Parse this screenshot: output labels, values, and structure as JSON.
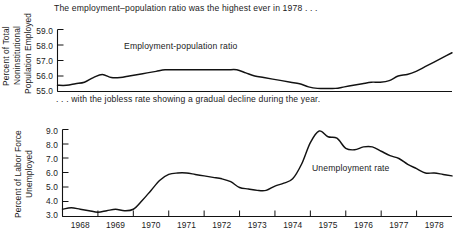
{
  "figure": {
    "caption_top": "The employment–population ratio was the highest ever in 1978 . . .",
    "caption_middle": ". . . with the jobless rate showing a gradual decline during the year.",
    "line_color": "#121212",
    "background": "#ffffff"
  },
  "chart_data": [
    {
      "type": "line",
      "title": "The employment–population ratio was the highest ever in 1978 . . .",
      "series_label": "Employment-population ratio",
      "xlabel": "",
      "ylabel": "Percent of Total Noninstitutional Population Employed",
      "ylabel_lines": [
        "Percent of Total",
        "Noninstitutional",
        "Population Employed"
      ],
      "ytick_labels": [
        "59.0",
        "58.0",
        "57.0",
        "56.0",
        "55.0"
      ],
      "ylim": [
        55.0,
        59.0
      ],
      "xlim": [
        1968.0,
        1979.0
      ],
      "grid": false,
      "legend": "inline-annotation",
      "x": [
        1968.0,
        1968.25,
        1968.5,
        1968.75,
        1969.0,
        1969.25,
        1969.5,
        1969.75,
        1970.0,
        1970.25,
        1970.5,
        1970.75,
        1971.0,
        1971.25,
        1971.5,
        1971.75,
        1972.0,
        1972.25,
        1972.5,
        1972.75,
        1973.0,
        1973.25,
        1973.5,
        1973.75,
        1974.0,
        1974.25,
        1974.5,
        1974.75,
        1975.0,
        1975.25,
        1975.5,
        1975.75,
        1976.0,
        1976.25,
        1976.5,
        1976.75,
        1977.0,
        1977.25,
        1977.5,
        1977.75,
        1978.0,
        1978.25,
        1978.5,
        1978.75,
        1979.0
      ],
      "values": [
        55.4,
        55.4,
        55.5,
        55.6,
        55.9,
        56.1,
        55.9,
        55.9,
        56.0,
        56.1,
        56.2,
        56.3,
        56.4,
        56.4,
        56.4,
        56.4,
        56.4,
        56.4,
        56.4,
        56.4,
        56.4,
        56.2,
        56.0,
        55.9,
        55.8,
        55.7,
        55.6,
        55.5,
        55.3,
        55.2,
        55.2,
        55.2,
        55.3,
        55.4,
        55.5,
        55.6,
        55.6,
        55.7,
        56.0,
        56.1,
        56.3,
        56.6,
        56.9,
        57.2,
        57.5
      ]
    },
    {
      "type": "line",
      "title": ". . . with the jobless rate showing a gradual decline during the year.",
      "series_label": "Unemployment rate",
      "xlabel": "",
      "ylabel": "Percent of Labor Force Unemployed",
      "ylabel_lines": [
        "Percent of Labor Force",
        "Unemployed"
      ],
      "ytick_labels": [
        "9.0",
        "8.0",
        "7.0",
        "6.0",
        "5.0",
        "4.0",
        "3.0"
      ],
      "ylim": [
        3.0,
        9.0
      ],
      "xlim": [
        1968.0,
        1979.0
      ],
      "grid": false,
      "legend": "inline-annotation",
      "xtick_labels": [
        "1968",
        "1969",
        "1970",
        "1971",
        "1972",
        "1973",
        "1974",
        "1975",
        "1976",
        "1977",
        "1978"
      ],
      "x": [
        1968.0,
        1968.25,
        1968.5,
        1968.75,
        1969.0,
        1969.25,
        1969.5,
        1969.75,
        1970.0,
        1970.25,
        1970.5,
        1970.75,
        1971.0,
        1971.25,
        1971.5,
        1971.75,
        1972.0,
        1972.25,
        1972.5,
        1972.75,
        1973.0,
        1973.25,
        1973.5,
        1973.75,
        1974.0,
        1974.25,
        1974.5,
        1974.75,
        1975.0,
        1975.25,
        1975.5,
        1975.75,
        1976.0,
        1976.25,
        1976.5,
        1976.75,
        1977.0,
        1977.25,
        1977.5,
        1977.75,
        1978.0,
        1978.25,
        1978.5,
        1978.75,
        1979.0
      ],
      "values": [
        3.5,
        3.6,
        3.5,
        3.4,
        3.3,
        3.4,
        3.5,
        3.4,
        3.5,
        4.1,
        4.8,
        5.5,
        5.9,
        6.0,
        6.0,
        5.9,
        5.8,
        5.7,
        5.6,
        5.4,
        5.0,
        4.9,
        4.8,
        4.8,
        5.1,
        5.3,
        5.6,
        6.6,
        8.1,
        8.9,
        8.5,
        8.4,
        7.7,
        7.6,
        7.8,
        7.8,
        7.5,
        7.2,
        7.0,
        6.6,
        6.3,
        6.0,
        6.0,
        5.9,
        5.8
      ]
    }
  ],
  "axis_top": {
    "ytitle_a": "Percent of Total",
    "ytitle_b": "Noninstitutional",
    "ytitle_c": "Population Employed",
    "ticks": [
      {
        "label": "59.0"
      },
      {
        "label": "58.0"
      },
      {
        "label": "57.0"
      },
      {
        "label": "56.0"
      },
      {
        "label": "55.0"
      }
    ],
    "series_label": "Employment-population ratio"
  },
  "axis_bottom": {
    "ytitle_a": "Percent of Labor Force",
    "ytitle_b": "Unemployed",
    "ticks": [
      {
        "label": "9.0"
      },
      {
        "label": "8.0"
      },
      {
        "label": "7.0"
      },
      {
        "label": "6.0"
      },
      {
        "label": "5.0"
      },
      {
        "label": "4.0"
      },
      {
        "label": "3.0"
      }
    ],
    "series_label": "Unemployment rate",
    "xticks": [
      {
        "label": "1968"
      },
      {
        "label": "1969"
      },
      {
        "label": "1970"
      },
      {
        "label": "1971"
      },
      {
        "label": "1972"
      },
      {
        "label": "1973"
      },
      {
        "label": "1974"
      },
      {
        "label": "1975"
      },
      {
        "label": "1976"
      },
      {
        "label": "1977"
      },
      {
        "label": "1978"
      }
    ]
  }
}
